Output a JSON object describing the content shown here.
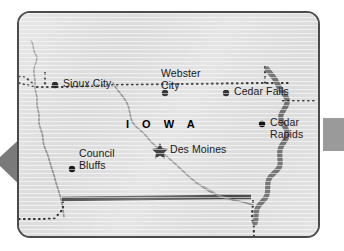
{
  "figure": {
    "name": "iowa-state-map",
    "state_label": "I O W A"
  },
  "colors": {
    "land_fill": "#dcdcdc",
    "frame_border": "#4b4b4b",
    "river_line": "#8c8c8c",
    "mississippi": "#6e6e6e",
    "state_boundary_dotted": "#2b2b2b",
    "south_border": "#4a4a4a",
    "label_text": "#1a1a1a",
    "arrow_gray": "#7a7a7a",
    "tab_gray": "#9a9a9a",
    "page_background": "#ffffff"
  },
  "cities": [
    {
      "id": "sioux-city",
      "name": "Sioux City",
      "lines": [
        "Sioux City"
      ],
      "marker": "dot",
      "marker_x": 36,
      "marker_y": 72,
      "label_x": 44,
      "label_y": 65,
      "two_line": false
    },
    {
      "id": "webster-city",
      "name": "Webster City",
      "lines": [
        "Webster",
        "City"
      ],
      "marker": "dot",
      "marker_x": 146,
      "marker_y": 80,
      "label_x": 142,
      "label_y": 55,
      "two_line": true
    },
    {
      "id": "cedar-falls",
      "name": "Cedar Falls",
      "lines": [
        "Cedar Falls"
      ],
      "marker": "dot",
      "marker_x": 207,
      "marker_y": 80,
      "label_x": 215,
      "label_y": 73,
      "two_line": false
    },
    {
      "id": "cedar-rapids",
      "name": "Cedar Rapids",
      "lines": [
        "Cedar",
        "Rapids"
      ],
      "marker": "dot",
      "marker_x": 243,
      "marker_y": 111,
      "label_x": 251,
      "label_y": 104,
      "two_line": true
    },
    {
      "id": "des-moines",
      "name": "Des Moines",
      "lines": [
        "Des Moines"
      ],
      "marker": "star",
      "marker_x": 141,
      "marker_y": 137,
      "label_x": 151,
      "label_y": 131,
      "two_line": false
    },
    {
      "id": "council-bluffs",
      "name": "Council Bluffs",
      "lines": [
        "Council",
        "Bluffs"
      ],
      "marker": "dot",
      "marker_x": 53,
      "marker_y": 156,
      "label_x": 60,
      "label_y": 135,
      "two_line": true
    }
  ],
  "decorations": {
    "left_arrow_name": "left-pointing-arrow",
    "right_tab_name": "right-edge-tab"
  },
  "legend": {
    "capital_marker": "star",
    "city_marker": "dot"
  }
}
